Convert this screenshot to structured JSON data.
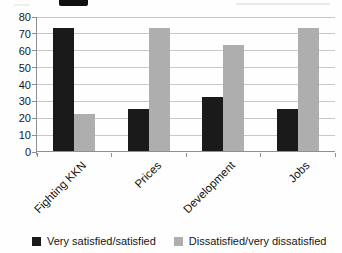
{
  "chart_data": {
    "type": "bar",
    "title": "",
    "categories": [
      "Fighting KKN",
      "Prices",
      "Development",
      "Jobs"
    ],
    "series": [
      {
        "name": "Very satisfied/satisfied",
        "color": "#1a1a1a",
        "values": [
          73,
          25,
          32,
          25
        ]
      },
      {
        "name": "Dissatisfied/very dissatisfied",
        "color": "#aeaeae",
        "values": [
          22,
          73,
          63,
          73
        ]
      }
    ],
    "xlabel": "",
    "ylabel": "",
    "ylim": [
      0,
      80
    ],
    "y_ticks": [
      0,
      10,
      20,
      30,
      40,
      50,
      60,
      70,
      80
    ],
    "grid": true,
    "legend_position": "bottom",
    "x_label_rotation_deg": -45,
    "colors": {
      "gridline": "#c9c9c9",
      "axis": "#8f8f8f",
      "text": "#161616"
    }
  }
}
